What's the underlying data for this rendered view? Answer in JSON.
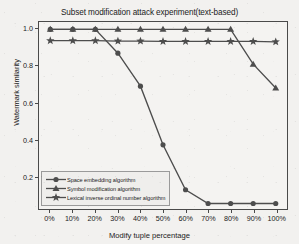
{
  "chart_data": {
    "type": "line",
    "title": "Subset modification attack experiment(text-based)",
    "xlabel": "Modify tuple percentage",
    "ylabel": "Watermark similarity",
    "categories": [
      "0%",
      "10%",
      "20%",
      "30%",
      "40%",
      "50%",
      "60%",
      "70%",
      "80%",
      "90%",
      "100%"
    ],
    "x": [
      0,
      10,
      20,
      30,
      40,
      50,
      60,
      70,
      80,
      90,
      100
    ],
    "xlim": [
      -5,
      105
    ],
    "ylim": [
      0.02,
      1.04
    ],
    "yticks": [
      "1.0",
      "0.8",
      "0.6",
      "0.4",
      "0.2"
    ],
    "ytick_values": [
      1.0,
      0.8,
      0.6,
      0.4,
      0.2
    ],
    "grid": false,
    "legend_position": "lower left",
    "series": [
      {
        "name": "Space embedding algorithm",
        "marker": "circle",
        "color": "#4d4d4d",
        "values": [
          1.0,
          1.0,
          1.0,
          0.87,
          0.69,
          0.37,
          0.125,
          0.05,
          0.05,
          0.05,
          0.05
        ]
      },
      {
        "name": "Symbol modification algorithm",
        "marker": "triangle",
        "color": "#4d4d4d",
        "values": [
          1.0,
          1.0,
          1.0,
          1.0,
          1.0,
          1.0,
          1.0,
          1.0,
          1.0,
          0.81,
          0.68
        ]
      },
      {
        "name": "Lexical inverse ordinal number algorithm",
        "marker": "star",
        "color": "#4d4d4d",
        "values": [
          0.938,
          0.938,
          0.938,
          0.936,
          0.936,
          0.934,
          0.934,
          0.934,
          0.934,
          0.934,
          0.932
        ]
      }
    ]
  },
  "colors": {
    "series": "#4d4d4d",
    "axis": "#4a4a4a",
    "text": "#1b1b1b",
    "background": "#f2f1ef",
    "legend_background": "#efeeec",
    "legend_border": "#9a9a9a"
  }
}
